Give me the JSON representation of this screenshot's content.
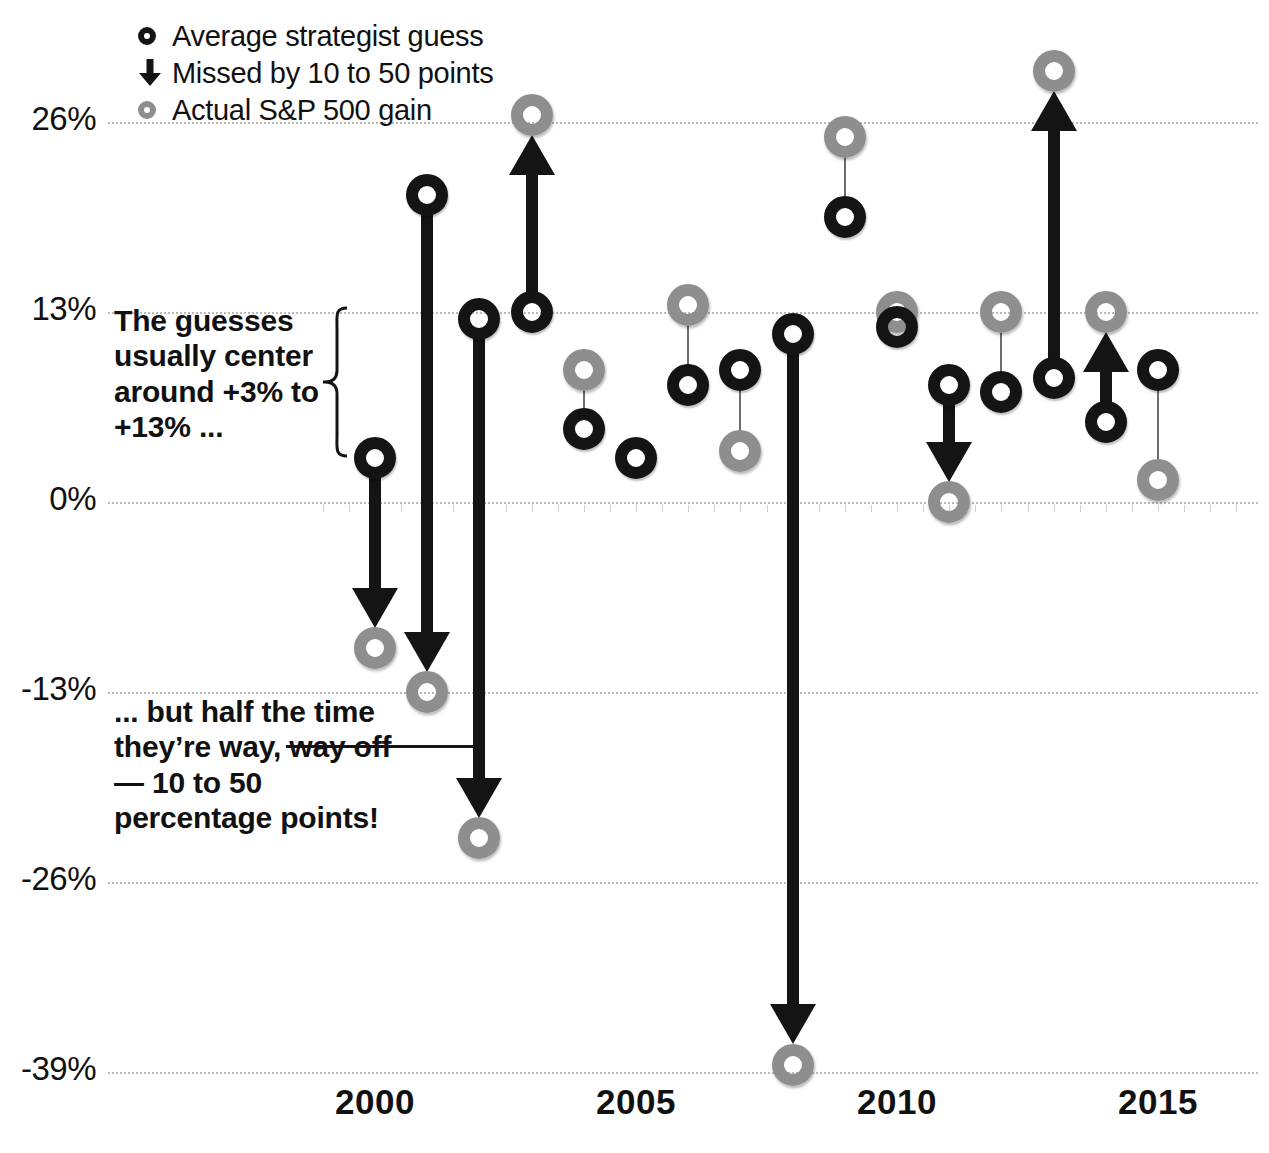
{
  "legend": {
    "items": [
      {
        "icon": "dark-ring-icon",
        "label": "Average strategist guess"
      },
      {
        "icon": "down-arrow-icon",
        "label": "Missed by 10 to 50 points"
      },
      {
        "icon": "gray-ring-icon",
        "label": "Actual S&P 500 gain"
      }
    ]
  },
  "annotations": {
    "top": "The guesses usually center around +3% to +13% ...",
    "bottom": "... but half the time they’re way, way off — 10 to 50 percentage points!"
  },
  "axis": {
    "y_ticks": [
      "26%",
      "13%",
      "0%",
      "-13%",
      "-26%",
      "-39%"
    ],
    "x_ticks": [
      "2000",
      "2005",
      "2010",
      "2015"
    ]
  },
  "colors": {
    "guess": "#141414",
    "actual": "#8e8e8e",
    "grid": "#b9b9b9",
    "text": "#111111",
    "background": "#ffffff"
  },
  "chart_data": {
    "type": "scatter",
    "title": "",
    "subtitle": "",
    "xlabel": "",
    "ylabel": "",
    "xlim": [
      1999.4,
      2016.2
    ],
    "ylim": [
      -39,
      31
    ],
    "grid": true,
    "legend_position": "top-left",
    "yticks": [
      26,
      13,
      0,
      -13,
      -26,
      -39
    ],
    "xticks": [
      2000,
      2005,
      2010,
      2015
    ],
    "series": [
      {
        "name": "Average strategist guess",
        "color": "#141414"
      },
      {
        "name": "Actual S&P 500 gain",
        "color": "#8e8e8e"
      }
    ],
    "points": [
      {
        "year": 2000,
        "guess": 3.0,
        "actual": -10.0,
        "big_miss": true,
        "direction": "down"
      },
      {
        "year": 2001,
        "guess": 21.0,
        "actual": -13.0,
        "big_miss": true,
        "direction": "down"
      },
      {
        "year": 2002,
        "guess": 12.5,
        "actual": -23.0,
        "big_miss": true,
        "direction": "down"
      },
      {
        "year": 2003,
        "guess": 13.0,
        "actual": 26.5,
        "big_miss": true,
        "direction": "up"
      },
      {
        "year": 2004,
        "guess": 5.0,
        "actual": 9.0,
        "big_miss": false,
        "direction": "up"
      },
      {
        "year": 2005,
        "guess": 3.0,
        "actual": null,
        "big_miss": false,
        "direction": "none"
      },
      {
        "year": 2006,
        "guess": 8.0,
        "actual": 13.5,
        "big_miss": false,
        "direction": "up"
      },
      {
        "year": 2007,
        "guess": 9.0,
        "actual": 3.5,
        "big_miss": false,
        "direction": "down"
      },
      {
        "year": 2008,
        "guess": 11.5,
        "actual": -38.5,
        "big_miss": true,
        "direction": "down"
      },
      {
        "year": 2009,
        "guess": 19.5,
        "actual": 25.0,
        "big_miss": false,
        "direction": "up"
      },
      {
        "year": 2010,
        "guess": 12.0,
        "actual": 13.0,
        "big_miss": false,
        "direction": "up"
      },
      {
        "year": 2011,
        "guess": 8.0,
        "actual": 0.0,
        "big_miss": true,
        "direction": "down"
      },
      {
        "year": 2012,
        "guess": 7.5,
        "actual": 13.0,
        "big_miss": false,
        "direction": "up"
      },
      {
        "year": 2013,
        "guess": 8.5,
        "actual": 29.5,
        "big_miss": true,
        "direction": "up"
      },
      {
        "year": 2014,
        "guess": 5.5,
        "actual": 13.0,
        "big_miss": true,
        "direction": "up"
      },
      {
        "year": 2015,
        "guess": 9.0,
        "actual": 1.5,
        "big_miss": false,
        "direction": "down"
      }
    ]
  }
}
